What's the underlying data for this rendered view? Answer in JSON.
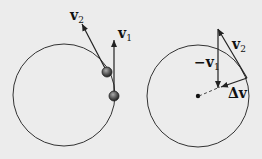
{
  "left_panel": {
    "circle": {
      "cx": 64,
      "cy": 95,
      "r": 51
    },
    "balls": [
      {
        "cx": 107,
        "cy": 72
      },
      {
        "cx": 114,
        "cy": 96
      }
    ],
    "vectors": {
      "v1": {
        "x1": 114,
        "y1": 96,
        "x2": 114,
        "y2": 40,
        "label": "v",
        "sub": "1"
      },
      "v2": {
        "x1": 107,
        "y1": 72,
        "x2": 82,
        "y2": 24,
        "label": "v",
        "sub": "2"
      }
    }
  },
  "right_panel": {
    "circle": {
      "cx": 198,
      "cy": 96,
      "r": 51
    },
    "center_dot": {
      "cx": 198,
      "cy": 96
    },
    "vectors": {
      "neg_v1": {
        "x1": 218,
        "y1": 29,
        "x2": 218,
        "y2": 88,
        "label": "−v",
        "sub": "1"
      },
      "v2": {
        "x1": 247,
        "y1": 78,
        "x2": 218,
        "y2": 29,
        "label": "v",
        "sub": "2"
      },
      "delta_v": {
        "x1": 247,
        "y1": 78,
        "x2": 220,
        "y2": 87,
        "label": "Δv"
      }
    },
    "dashed": {
      "x1": 198,
      "y1": 96,
      "x2": 220,
      "y2": 87
    }
  },
  "colors": {
    "line": "#222222",
    "background": "#ececec",
    "ball": "#555555"
  }
}
